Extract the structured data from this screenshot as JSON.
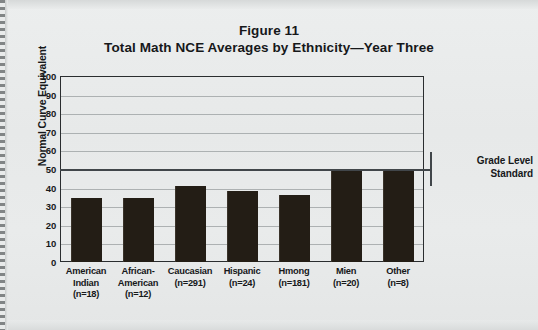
{
  "figure": {
    "title_line1": "Figure 11",
    "title_line2": "Total Math NCE Averages by Ethnicity—Year Three"
  },
  "annotation": {
    "standard_label_top": "Grade Level",
    "standard_label_bottom": "Standard",
    "standard_value": 50
  },
  "chart_data": {
    "type": "bar",
    "title": "Total Math NCE Averages by Ethnicity—Year Three",
    "subtitle": "Figure 11",
    "xlabel": "",
    "ylabel": "Normal Curve Equivalent",
    "ylim": [
      0,
      100
    ],
    "ytick_step": 10,
    "yticks": [
      "100",
      "90",
      "80",
      "70",
      "60",
      "50",
      "40",
      "30",
      "20",
      "10",
      "0"
    ],
    "grid": true,
    "legend": "none",
    "bar_color": "#231d15",
    "categories": [
      "American Indian",
      "African-American",
      "Caucasian",
      "Hispanic",
      "Hmong",
      "Mien",
      "Other"
    ],
    "category_labels": [
      [
        "American",
        "Indian",
        "(n=18)"
      ],
      [
        "African-",
        "American",
        "(n=12)"
      ],
      [
        "Caucasian",
        "(n=291)"
      ],
      [
        "Hispanic",
        "(n=24)"
      ],
      [
        "Hmong",
        "(n=181)"
      ],
      [
        "Mien",
        "(n=20)"
      ],
      [
        "Other",
        "(n=8)"
      ]
    ],
    "sample_sizes": [
      18,
      12,
      291,
      24,
      181,
      20,
      8
    ],
    "values": [
      34.5,
      34.5,
      41,
      38,
      36,
      49,
      50
    ],
    "reference_lines": [
      {
        "label": "Grade Level Standard",
        "value": 50
      }
    ]
  }
}
